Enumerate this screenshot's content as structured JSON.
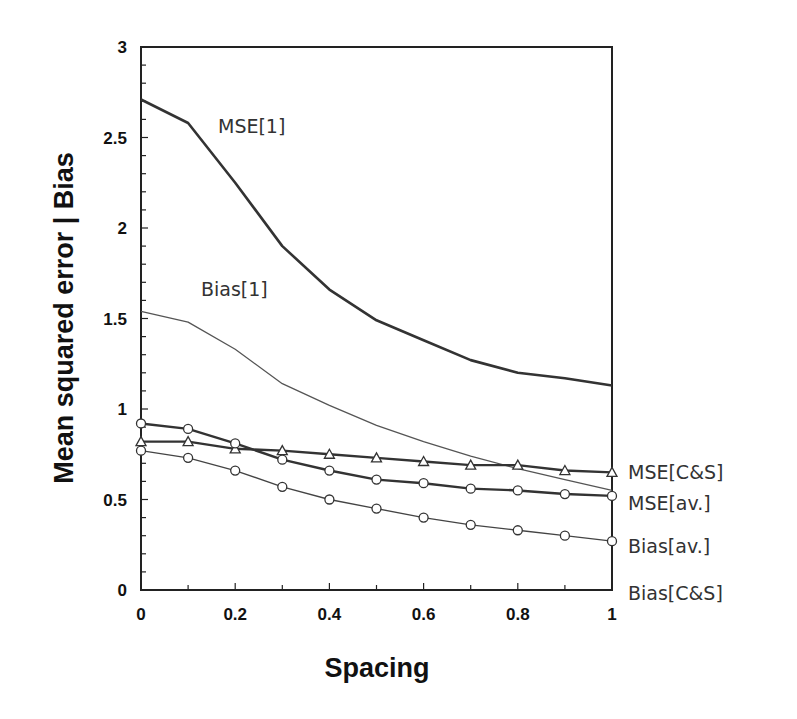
{
  "chart_data": {
    "type": "line",
    "title": "",
    "xlabel": "Spacing",
    "ylabel": "Mean squared error | Bias",
    "xlim": [
      0,
      1
    ],
    "ylim": [
      0,
      3
    ],
    "x_ticks": [
      "0",
      "0.2",
      "0.4",
      "0.6",
      "0.8",
      "1"
    ],
    "y_ticks": [
      "0",
      "0.5",
      "1",
      "1.5",
      "2",
      "2.5",
      "3"
    ],
    "grid": false,
    "legend": "inline labels (right side and in-plot)",
    "x": [
      0,
      0.1,
      0.2,
      0.3,
      0.4,
      0.5,
      0.6,
      0.7,
      0.8,
      0.9,
      1.0
    ],
    "series": [
      {
        "name": "MSE[1]",
        "style": "thick line, no markers",
        "values": [
          2.71,
          2.58,
          2.25,
          1.9,
          1.66,
          1.49,
          1.38,
          1.27,
          1.2,
          1.17,
          1.13
        ]
      },
      {
        "name": "Bias[1]",
        "style": "thin line, no markers",
        "values": [
          1.54,
          1.48,
          1.33,
          1.14,
          1.02,
          0.91,
          0.82,
          0.74,
          0.67,
          0.61,
          0.55
        ]
      },
      {
        "name": "MSE[C&S]",
        "style": "thick line, triangle markers",
        "values": [
          0.82,
          0.82,
          0.78,
          0.77,
          0.75,
          0.73,
          0.71,
          0.69,
          0.69,
          0.66,
          0.65
        ]
      },
      {
        "name": "MSE[av.]",
        "style": "thick line, circle markers",
        "values": [
          0.92,
          0.89,
          0.81,
          0.72,
          0.66,
          0.61,
          0.59,
          0.56,
          0.55,
          0.53,
          0.52
        ]
      },
      {
        "name": "Bias[av.]",
        "style": "thin line, circle markers",
        "values": [
          0.77,
          0.73,
          0.66,
          0.57,
          0.5,
          0.45,
          0.4,
          0.36,
          0.33,
          0.3,
          0.27
        ]
      },
      {
        "name": "Bias[C&S]",
        "style": "at zero (coincides with x-axis)",
        "values": [
          0,
          0,
          0,
          0,
          0,
          0,
          0,
          0,
          0,
          0,
          0
        ]
      }
    ]
  },
  "labels": {
    "mse1": "MSE[1]",
    "bias1": "Bias[1]",
    "mse_cs": "MSE[C&S]",
    "mse_av": "MSE[av.]",
    "bias_av": "Bias[av.]",
    "bias_cs": "Bias[C&S]"
  },
  "axes": {
    "xlabel": "Spacing",
    "ylabel": "Mean squared error | Bias",
    "x_ticks": [
      "0",
      "0.2",
      "0.4",
      "0.6",
      "0.8",
      "1"
    ],
    "y_ticks": [
      "0",
      "0.5",
      "1",
      "1.5",
      "2",
      "2.5",
      "3"
    ]
  }
}
